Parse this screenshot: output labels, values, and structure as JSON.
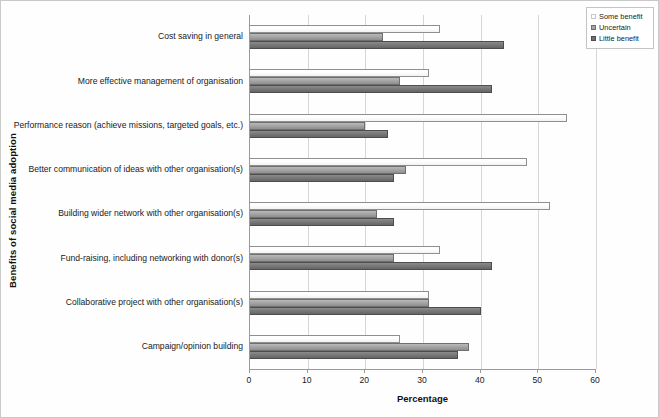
{
  "chart_data": {
    "type": "bar",
    "orientation": "horizontal",
    "title": "",
    "xlabel": "Percentage",
    "ylabel": "Benefits of social media adoption",
    "xlim": [
      0,
      60
    ],
    "xticks": [
      0,
      10,
      20,
      30,
      40,
      50,
      60
    ],
    "grid": true,
    "legend_position": "top-right",
    "categories": [
      "Cost saving in general",
      "More effective management of organisation",
      "Performance reason (achieve missions, targeted goals, etc.)",
      "Better communication of ideas with other organisation(s)",
      "Building wider network with other organisation(s)",
      "Fund-raising, including networking with donor(s)",
      "Collaborative project with other organisation(s)",
      "Campaign/opinion building"
    ],
    "series": [
      {
        "name": "Some benefit",
        "color": "#fdfdfd",
        "values": [
          33,
          31,
          55,
          48,
          52,
          33,
          31,
          26
        ]
      },
      {
        "name": "Uncertain",
        "color": "#a5a5a5",
        "values": [
          23,
          26,
          20,
          27,
          22,
          25,
          31,
          38
        ]
      },
      {
        "name": "Little benefit",
        "color": "#6f6f6f",
        "values": [
          44,
          42,
          24,
          25,
          25,
          42,
          40,
          36
        ]
      }
    ]
  },
  "legend": {
    "items": [
      {
        "label": "Some benefit"
      },
      {
        "label": "Uncertain"
      },
      {
        "label": "Little benefit"
      }
    ]
  },
  "axes": {
    "x_title": "Percentage",
    "y_title": "Benefits of social media adoption",
    "x_tick_labels": [
      "0",
      "10",
      "20",
      "30",
      "40",
      "50",
      "60"
    ]
  }
}
